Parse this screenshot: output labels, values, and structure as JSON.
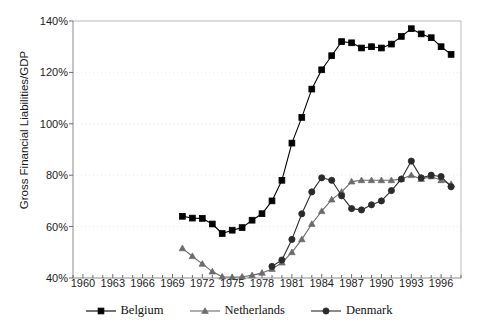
{
  "chart_data": {
    "type": "line",
    "title": "",
    "xlabel": "",
    "ylabel": "Gross Financial Liabilities/GDP",
    "xlim": [
      1959,
      1998
    ],
    "ylim": [
      40,
      140
    ],
    "ytick_labels": [
      "40%",
      "60%",
      "80%",
      "100%",
      "120%",
      "140%"
    ],
    "ytick_values": [
      40,
      60,
      80,
      100,
      120,
      140
    ],
    "xtick_labels": [
      "1960",
      "1963",
      "1966",
      "1969",
      "1972",
      "1975",
      "1978",
      "1981",
      "1984",
      "1987",
      "1990",
      "1993",
      "1996"
    ],
    "xtick_values": [
      1960,
      1963,
      1966,
      1969,
      1972,
      1975,
      1978,
      1981,
      1984,
      1987,
      1990,
      1993,
      1996
    ],
    "grid": "horizontal-dotted",
    "legend_position": "bottom-center",
    "minor_xticks_every": 1,
    "series": [
      {
        "name": "Belgium",
        "marker": "square",
        "color": "#000000",
        "x": [
          1970,
          1971,
          1972,
          1973,
          1974,
          1975,
          1976,
          1977,
          1978,
          1979,
          1980,
          1981,
          1982,
          1983,
          1984,
          1985,
          1986,
          1987,
          1988,
          1989,
          1990,
          1991,
          1992,
          1993,
          1994,
          1995,
          1996,
          1997
        ],
        "values": [
          64.0,
          63.3,
          63.2,
          61.0,
          57.3,
          58.6,
          59.6,
          62.5,
          65.0,
          70.0,
          78.0,
          92.5,
          102.5,
          113.5,
          121.0,
          126.5,
          132.0,
          131.5,
          129.5,
          130.0,
          129.5,
          131.0,
          134.0,
          137.0,
          135.0,
          133.5,
          130.0,
          127.0
        ]
      },
      {
        "name": "Netherlands",
        "marker": "triangle",
        "color": "#6b6b6b",
        "x": [
          1970,
          1971,
          1972,
          1973,
          1974,
          1975,
          1976,
          1977,
          1978,
          1979,
          1980,
          1981,
          1982,
          1983,
          1984,
          1985,
          1986,
          1987,
          1988,
          1989,
          1990,
          1991,
          1992,
          1993,
          1994,
          1995,
          1996,
          1997
        ],
        "values": [
          51.5,
          48.5,
          45.5,
          42.5,
          40.5,
          40.3,
          40.5,
          41.0,
          42.0,
          43.5,
          46.0,
          50.0,
          55.0,
          61.0,
          66.0,
          70.5,
          73.5,
          77.5,
          78.0,
          78.0,
          78.0,
          78.0,
          78.5,
          80.0,
          78.5,
          79.5,
          78.0,
          76.5
        ]
      },
      {
        "name": "Denmark",
        "marker": "circle",
        "color": "#2b2b2b",
        "x": [
          1979,
          1980,
          1981,
          1982,
          1983,
          1984,
          1985,
          1986,
          1987,
          1988,
          1989,
          1990,
          1991,
          1992,
          1993,
          1994,
          1995,
          1996,
          1997
        ],
        "values": [
          44.5,
          47.0,
          55.0,
          65.0,
          73.5,
          79.0,
          78.0,
          72.0,
          67.0,
          66.5,
          68.5,
          70.0,
          74.0,
          78.5,
          85.5,
          79.0,
          80.0,
          79.5,
          75.5
        ]
      }
    ]
  },
  "legend": {
    "items": [
      {
        "label": "Belgium",
        "marker": "square"
      },
      {
        "label": "Netherlands",
        "marker": "triangle"
      },
      {
        "label": "Denmark",
        "marker": "circle"
      }
    ]
  }
}
